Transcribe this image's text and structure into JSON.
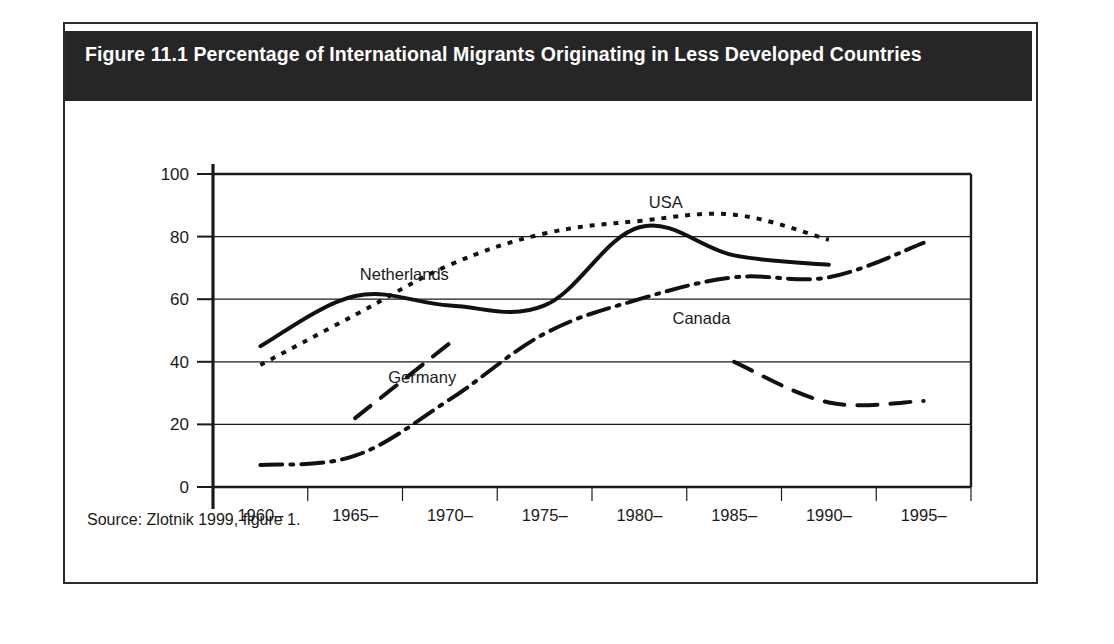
{
  "figure": {
    "title": "Figure 11.1 Percentage of International Migrants Originating in Less Developed Countries",
    "source": "Source: Zlotnik 1999, figure 1.",
    "frame_color": "#2b2b2b",
    "banner_color": "#262626",
    "banner_text_color": "#ffffff"
  },
  "chart_data": {
    "type": "line",
    "title": "Figure 11.1 Percentage of International Migrants Originating in Less Developed Countries",
    "xlabel": "",
    "ylabel": "",
    "ylim": [
      0,
      100
    ],
    "yticks": [
      0,
      20,
      40,
      60,
      80,
      100
    ],
    "ytick_labels": [
      "0",
      "20",
      "40",
      "60",
      "80",
      "100"
    ],
    "grid": true,
    "legend": "inline-labels",
    "categories": [
      "1960–\n1964",
      "1965–\n1969",
      "1970–\n1974",
      "1975–\n1979",
      "1980–\n1984",
      "1985–\n1989",
      "1990–\n1994",
      "1995–\n1999"
    ],
    "category_lines": [
      [
        "1960–",
        "1964"
      ],
      [
        "1965–",
        "1969"
      ],
      [
        "1970–",
        "1974"
      ],
      [
        "1975–",
        "1979"
      ],
      [
        "1980–",
        "1984"
      ],
      [
        "1985–",
        "1989"
      ],
      [
        "1990–",
        "1994"
      ],
      [
        "1995–",
        "1999"
      ]
    ],
    "series": [
      {
        "name": "Netherlands",
        "style": "solid",
        "label": "Netherlands",
        "label_x": 1.05,
        "label_y": 68,
        "values": [
          45,
          61,
          58,
          58,
          83,
          74,
          71,
          null
        ]
      },
      {
        "name": "USA",
        "style": "dotted",
        "label": "USA",
        "label_x": 4.1,
        "label_y": 91,
        "values": [
          39,
          55,
          71,
          81,
          85,
          87,
          79,
          null
        ]
      },
      {
        "name": "Germany",
        "style": "dashed",
        "label": "Germany",
        "label_x": 1.35,
        "label_y": 35,
        "values": [
          null,
          22,
          46,
          null,
          null,
          40,
          27,
          27.5
        ]
      },
      {
        "name": "Canada",
        "style": "dashdot",
        "label": "Canada",
        "label_x": 4.35,
        "label_y": 54,
        "values": [
          7,
          10,
          28,
          49,
          60,
          67,
          67,
          78
        ]
      }
    ]
  }
}
